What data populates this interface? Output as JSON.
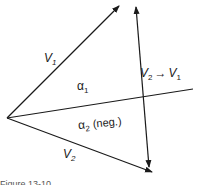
{
  "diagram": {
    "vectors": [
      {
        "name": "V1",
        "label": "V",
        "sub": "1",
        "from": [
          7,
          118
        ],
        "to": [
          120,
          5
        ]
      },
      {
        "name": "V2",
        "label": "V",
        "sub": "2",
        "from": [
          7,
          118
        ],
        "to": [
          152,
          172
        ]
      },
      {
        "name": "V2-V1",
        "label": "V2 → V1",
        "from": [
          149,
          167
        ],
        "to": [
          136,
          7
        ]
      }
    ],
    "reference_line": {
      "from": [
        7,
        118
      ],
      "to": [
        193,
        89
      ]
    },
    "angles": [
      {
        "symbol": "α",
        "sub": "1",
        "note": ""
      },
      {
        "symbol": "α",
        "sub": "2",
        "note": "(neg.)"
      }
    ],
    "labels": {
      "v1": "V",
      "v1_sub": "1",
      "v2": "V",
      "v2_sub": "2",
      "alpha1": "α",
      "alpha1_sub": "1",
      "alpha2": "α",
      "alpha2_sub": "2",
      "alpha2_note": "(neg.)",
      "diff_v2": "V",
      "diff_v2_sub": "2",
      "diff_arrow": "→",
      "diff_v1": "V",
      "diff_v1_sub": "1"
    },
    "caption": "Figure 13-10"
  }
}
